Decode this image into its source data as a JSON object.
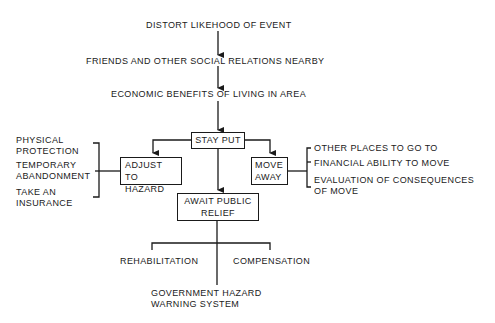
{
  "diagram": {
    "top_chain": [
      "DISTORT LIKEHOOD OF EVENT",
      "FRIENDS AND OTHER SOCIAL RELATIONS NEARBY",
      "ECONOMIC BENEFITS OF LIVING IN AREA"
    ],
    "stay_put": "STAY PUT",
    "adjust": {
      "line1": "ADJUST TO",
      "line2": "HAZARD"
    },
    "move": {
      "line1": "MOVE",
      "line2": "AWAY"
    },
    "await": {
      "line1": "AWAIT PUBLIC",
      "line2": "RELIEF"
    },
    "adjust_options": [
      {
        "line1": "PHYSICAL",
        "line2": "PROTECTION"
      },
      {
        "line1": "TEMPORARY",
        "line2": "ABANDONMENT"
      },
      {
        "line1": "TAKE AN",
        "line2": "INSURANCE"
      }
    ],
    "move_factors": [
      "OTHER PLACES TO GO TO",
      "FINANCIAL ABILITY TO MOVE",
      "EVALUATION OF CONSEQUENCES",
      "OF MOVE"
    ],
    "relief_options": {
      "left": "REHABILITATION",
      "right": "COMPENSATION",
      "bottom_line1": "GOVERNMENT HAZARD",
      "bottom_line2": "WARNING SYSTEM"
    },
    "line_color": "#1a1a1a"
  }
}
